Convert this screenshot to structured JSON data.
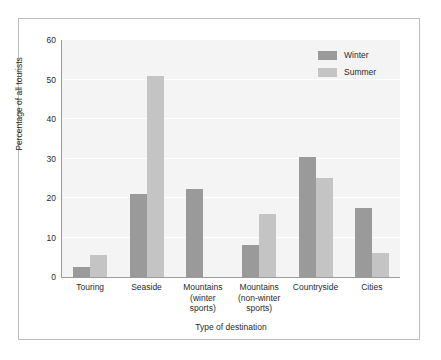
{
  "chart_data": {
    "type": "bar",
    "title": "",
    "subtitle": "",
    "xlabel": "Type of destination",
    "ylabel": "Percentage of all tourists",
    "categories": [
      "Touring",
      "Seaside",
      "Mountains\n(winter\nsports)",
      "Mountains\n(non-winter\nsports)",
      "Countryside",
      "Cities"
    ],
    "series": [
      {
        "name": "Winter",
        "color": "#9a9a9a",
        "values": [
          2.5,
          21,
          22.3,
          8,
          30.5,
          17.5
        ]
      },
      {
        "name": "Summer",
        "color": "#c4c4c4",
        "values": [
          5.5,
          51,
          0,
          16,
          25,
          6
        ]
      }
    ],
    "ylim": [
      0,
      60
    ],
    "yticks": [
      0,
      10,
      20,
      30,
      40,
      50,
      60
    ],
    "ytick_labels": [
      "0",
      "10",
      "20",
      "30",
      "40",
      "50",
      "60"
    ],
    "grid": true,
    "grid_axis": "y",
    "grid_color": "#ffffff",
    "plot_background": "#f4f4f4",
    "figure_background": "#ffffff",
    "frame_color": "#bdbdbd",
    "axis_color": "#9b9b9b",
    "text_color": "#2b2b2b",
    "legend": {
      "position": "top-right",
      "entries": [
        {
          "label": "Winter",
          "color": "#9a9a9a"
        },
        {
          "label": "Summer",
          "color": "#c4c4c4"
        }
      ]
    }
  }
}
